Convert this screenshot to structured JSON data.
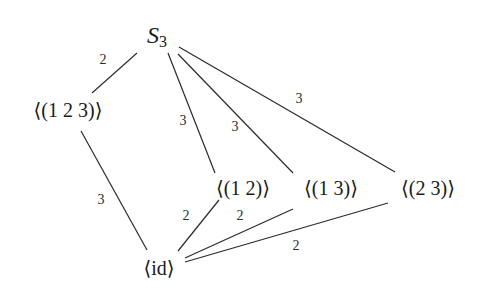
{
  "diagram": {
    "nodes": {
      "s3": {
        "main": "S",
        "sub": "3"
      },
      "c3": {
        "label": "⟨(1 2 3)⟩"
      },
      "t12": {
        "label": "⟨(1 2)⟩"
      },
      "t13": {
        "label": "⟨(1 3)⟩"
      },
      "t23": {
        "label": "⟨(2 3)⟩"
      },
      "id": {
        "label": "⟨id⟩"
      }
    },
    "edges": [
      {
        "from": "S3",
        "to": "⟨(1 2 3)⟩",
        "index": "2"
      },
      {
        "from": "S3",
        "to": "⟨(1 2)⟩",
        "index": "3"
      },
      {
        "from": "S3",
        "to": "⟨(1 3)⟩",
        "index": "3"
      },
      {
        "from": "S3",
        "to": "⟨(2 3)⟩",
        "index": "3"
      },
      {
        "from": "⟨(1 2 3)⟩",
        "to": "⟨id⟩",
        "index": "3"
      },
      {
        "from": "⟨(1 2)⟩",
        "to": "⟨id⟩",
        "index": "2"
      },
      {
        "from": "⟨(1 3)⟩",
        "to": "⟨id⟩",
        "index": "2"
      },
      {
        "from": "⟨(2 3)⟩",
        "to": "⟨id⟩",
        "index": "2"
      }
    ],
    "edge_labels": {
      "s3_c3": "2",
      "s3_t12": "3",
      "s3_t13": "3",
      "s3_t23": "3",
      "c3_id": "3",
      "t12_id": "2",
      "t13_id": "2",
      "t23_id": "2"
    },
    "colors": {
      "background": "#ffffff",
      "line": "#2a2a2a",
      "text": "#1a1a1a"
    }
  }
}
